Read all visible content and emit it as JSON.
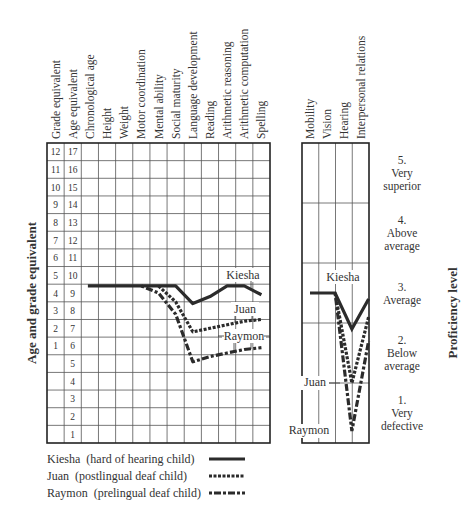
{
  "chart_data": {
    "type": "line",
    "title": "",
    "panels": [
      {
        "name": "achievement-profile",
        "ylabel": "Age and grade equivalent",
        "row_labels": {
          "grade_equivalent": [
            "12",
            "11",
            "10",
            "9",
            "8",
            "7",
            "6",
            "5",
            "4",
            "3",
            "2",
            "1",
            "",
            "",
            "",
            "",
            ""
          ],
          "age_equivalent": [
            "17",
            "16",
            "15",
            "14",
            "13",
            "12",
            "11",
            "10",
            "9",
            "8",
            "7",
            "6",
            "5",
            "4",
            "3",
            "2",
            "1"
          ]
        },
        "columns": [
          "Grade equivalent",
          "Age equivalent",
          "Chronological age",
          "Height",
          "Weight",
          "Motor coordination",
          "Mental ability",
          "Social maturity",
          "Language development",
          "Reading",
          "Arithmetic reasoning",
          "Arithmetic computation",
          "Spelling"
        ],
        "categories": [
          "Chronological age",
          "Height",
          "Weight",
          "Motor coordination",
          "Mental ability",
          "Social maturity",
          "Language development",
          "Reading",
          "Arithmetic reasoning",
          "Arithmetic computation",
          "Spelling"
        ],
        "ylim": [
          1,
          17
        ],
        "y_units": "age equivalent (years)",
        "series": [
          {
            "name": "Kiesha",
            "style": "solid",
            "values": [
              9.4,
              9.4,
              9.4,
              9.4,
              9.4,
              9.4,
              8.4,
              8.8,
              9.4,
              9.4,
              8.9
            ]
          },
          {
            "name": "Juan",
            "style": "dotted",
            "values": [
              null,
              null,
              null,
              null,
              9.4,
              8.5,
              6.8,
              7.0,
              7.2,
              7.4,
              7.5
            ]
          },
          {
            "name": "Raymon",
            "style": "dash-dot",
            "values": [
              null,
              null,
              null,
              9.4,
              9.0,
              7.8,
              5.1,
              5.4,
              5.6,
              5.8,
              5.9
            ]
          }
        ]
      },
      {
        "name": "proficiency-profile",
        "ylabel": "Proficiency level",
        "categories": [
          "Mobility",
          "Vision",
          "Hearing",
          "Interpersonal relations"
        ],
        "ylim": [
          1,
          5
        ],
        "levels": [
          {
            "num": "5.",
            "line1": "Very",
            "line2": "superior"
          },
          {
            "num": "4.",
            "line1": "Above",
            "line2": "average"
          },
          {
            "num": "3.",
            "line1": "Average",
            "line2": ""
          },
          {
            "num": "2.",
            "line1": "Below",
            "line2": "average"
          },
          {
            "num": "1.",
            "line1": "Very",
            "line2": "defective"
          }
        ],
        "series": [
          {
            "name": "Kiesha",
            "style": "solid",
            "values": [
              3.0,
              3.0,
              2.4,
              2.9
            ]
          },
          {
            "name": "Juan",
            "style": "dotted",
            "values": [
              null,
              3.0,
              1.5,
              2.6
            ]
          },
          {
            "name": "Raymon",
            "style": "dash-dot",
            "values": [
              null,
              3.0,
              0.7,
              2.2
            ]
          }
        ]
      }
    ],
    "legend": [
      {
        "label": "Kiesha  (hard of hearing child)",
        "style": "solid"
      },
      {
        "label": "Juan  (postlingual deaf child)",
        "style": "dotted"
      },
      {
        "label": "Raymon  (prelingual deaf child)",
        "style": "dash-dot"
      }
    ],
    "annotations": [
      "Kiesha",
      "Juan",
      "Raymon",
      "Kiesha",
      "Juan",
      "Raymon"
    ],
    "grid": true,
    "legend_position": "bottom-left"
  },
  "labels": {
    "left_ylabel": "Age and grade equivalent",
    "right_ylabel": "Proficiency level"
  },
  "colors": {
    "line": "#2b2b2b",
    "grid": "#555555",
    "text": "#333333"
  }
}
